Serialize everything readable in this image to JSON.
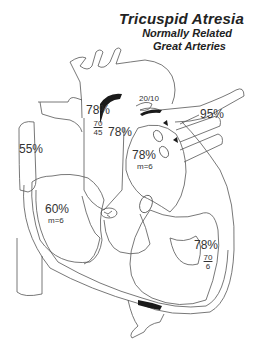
{
  "title": {
    "main": "Tricuspid Atresia",
    "line2": "Normally Related",
    "line3": "Great Arteries"
  },
  "colors": {
    "outline": "#555555",
    "fill_dark": "#1a1a1a",
    "text": "#333333"
  },
  "labels": {
    "svc_sat": "55%",
    "ra_sat": "60%",
    "ra_mean": "m=6",
    "aorta_sat": "78%",
    "aorta_pressure_sys": "70",
    "aorta_pressure_dia": "45",
    "pa_sat": "78%",
    "pa_pressure": "20/10",
    "la_sat": "78%",
    "la_mean": "m=6",
    "pv_sat": "95%",
    "lv_sat": "78%",
    "lv_pressure_sys": "70",
    "lv_pressure_dia": "6"
  }
}
